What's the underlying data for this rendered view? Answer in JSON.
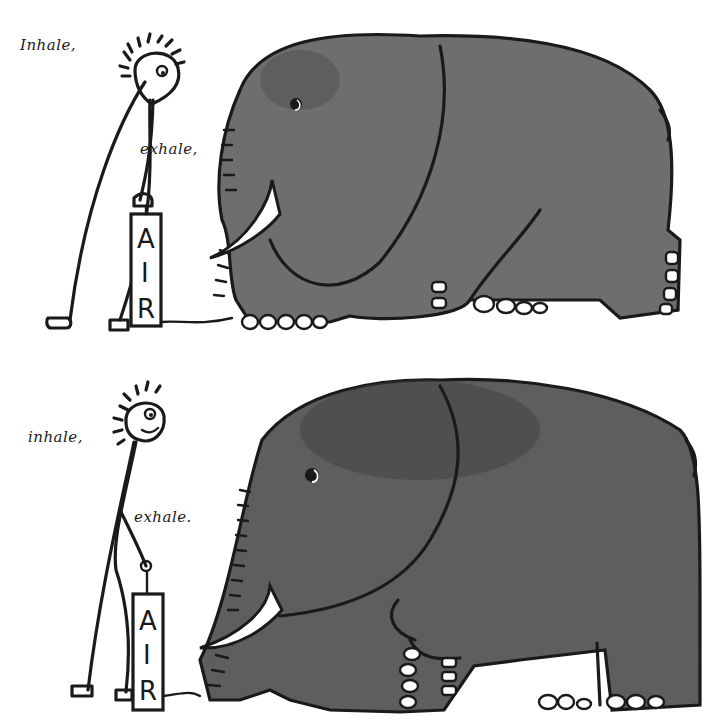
{
  "illustration": {
    "description": "Two-panel cartoon: a stick figure pumps an air pump labelled AIR into an elephant; in the second panel the elephant is larger.",
    "panels": [
      {
        "id": "top",
        "caption_inhale": "Inhale,",
        "caption_exhale": "exhale,",
        "pump_label": [
          "A",
          "I",
          "R"
        ],
        "elephant_size": "small"
      },
      {
        "id": "bottom",
        "caption_inhale": "inhale,",
        "caption_exhale": "exhale.",
        "pump_label": [
          "A",
          "I",
          "R"
        ],
        "elephant_size": "large"
      }
    ],
    "colors": {
      "background": "#ffffff",
      "ink": "#1a1a1a",
      "elephant_fill": "#6b6b6b",
      "elephant_shade": "#4a4a4a",
      "tusk": "#ffffff"
    }
  }
}
